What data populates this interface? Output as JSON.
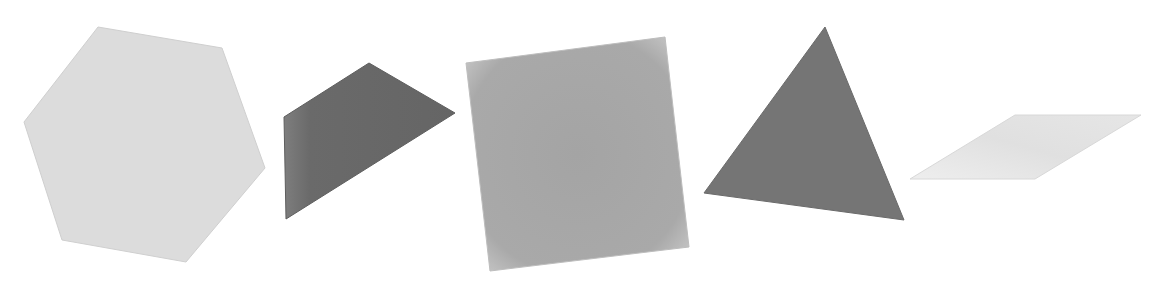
{
  "scene": {
    "width": 1170,
    "height": 287,
    "background": "#ffffff",
    "shapes": [
      {
        "name": "hexagon",
        "points": "98,27 222,48 265,168 186,262 62,240 24,122",
        "fill": "#dcdcdc",
        "edge": "#cfcfcf"
      },
      {
        "name": "quadrilateral",
        "points": "369,63 455,113 286,219 284,117",
        "fill": "#6b6b6b",
        "edge": "#5e5e5e"
      },
      {
        "name": "square",
        "points": "466,63 665,37 689,247 490,271",
        "fill": "#a8a8a8",
        "edge": "#bdbdbd"
      },
      {
        "name": "triangle",
        "points": "825,27 904,220 704,193",
        "fill": "#757575",
        "edge": "#6a6a6a"
      },
      {
        "name": "parallelogram",
        "points": "1015,115 1141,115 1035,179 910,179",
        "fill": "#e4e4e4",
        "edge": "#d8d8d8"
      }
    ]
  }
}
